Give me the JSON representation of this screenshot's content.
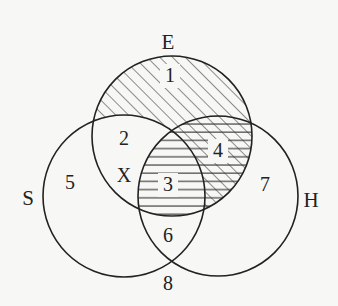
{
  "diagram": {
    "type": "venn",
    "sets": [
      {
        "id": "E",
        "label": "E",
        "cx": 172,
        "cy": 136,
        "r": 80
      },
      {
        "id": "S",
        "label": "S",
        "cx": 124,
        "cy": 196,
        "r": 81
      },
      {
        "id": "H",
        "label": "H",
        "cx": 218,
        "cy": 196,
        "r": 80
      }
    ],
    "set_labels": {
      "E": {
        "text": "E",
        "x": 168,
        "y": 49
      },
      "S": {
        "text": "S",
        "x": 28,
        "y": 205
      },
      "H": {
        "text": "H",
        "x": 311,
        "y": 207
      }
    },
    "regions": [
      {
        "id": "1",
        "label": "1",
        "x": 170,
        "y": 82,
        "sets": "E only",
        "shading": "diagonal"
      },
      {
        "id": "2",
        "label": "2",
        "x": 124,
        "y": 145,
        "sets": "E∩S not H",
        "shading": "none"
      },
      {
        "id": "X",
        "label": "X",
        "x": 124,
        "y": 182,
        "sets": "E∩S not H",
        "shading": "none"
      },
      {
        "id": "3",
        "label": "3",
        "x": 168,
        "y": 191,
        "sets": "E∩S∩H",
        "shading": "horizontal"
      },
      {
        "id": "4",
        "label": "4",
        "x": 218,
        "y": 157,
        "sets": "E∩H not S",
        "shading": "diagonal+horizontal"
      },
      {
        "id": "5",
        "label": "5",
        "x": 70,
        "y": 189,
        "sets": "S only",
        "shading": "none"
      },
      {
        "id": "6",
        "label": "6",
        "x": 168,
        "y": 242,
        "sets": "S∩H not E",
        "shading": "none"
      },
      {
        "id": "7",
        "label": "7",
        "x": 265,
        "y": 191,
        "sets": "H only",
        "shading": "none"
      },
      {
        "id": "8",
        "label": "8",
        "x": 168,
        "y": 290,
        "sets": "outside",
        "shading": "none"
      }
    ],
    "colors": {
      "stroke": "#222222",
      "background": "#f7f7f5"
    }
  }
}
